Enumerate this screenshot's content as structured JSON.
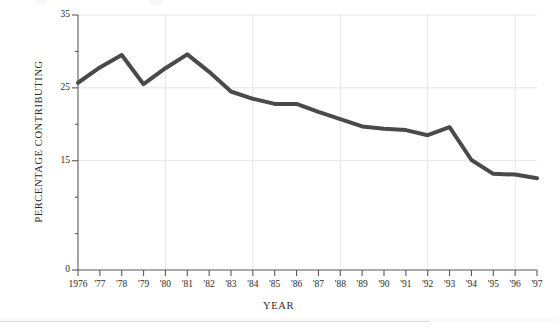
{
  "chart_data": {
    "type": "line",
    "title": "",
    "xlabel": "YEAR",
    "ylabel": "PERCENTAGE CONTRIBUTING",
    "xlim": [
      1976,
      1997
    ],
    "ylim": [
      0,
      35
    ],
    "y_ticks": [
      0,
      15,
      25,
      35
    ],
    "y_tick_labels": [
      "0",
      "15",
      "25",
      "35"
    ],
    "grid": "vertical gridlines every 4 years; horizontal gridlines at 15, 25, 35",
    "grid_y_values": [
      15,
      25,
      35
    ],
    "grid_x_values": [
      1980,
      1984,
      1988,
      1992,
      1996
    ],
    "legend": "none",
    "line_color": "#4a4a4a",
    "line_width": 4,
    "categories": [
      "1976",
      "'77",
      "'78",
      "'79",
      "'80",
      "'81",
      "'82",
      "'83",
      "'84",
      "'85",
      "'86",
      "'87",
      "'88",
      "'89",
      "'90",
      "'91",
      "'92",
      "'93",
      "'94",
      "'95",
      "'96",
      "'97"
    ],
    "x": [
      1976,
      1977,
      1978,
      1979,
      1980,
      1981,
      1982,
      1983,
      1984,
      1985,
      1986,
      1987,
      1988,
      1989,
      1990,
      1991,
      1992,
      1993,
      1994,
      1995,
      1996,
      1997
    ],
    "values": [
      25.7,
      27.8,
      29.5,
      25.5,
      27.7,
      29.6,
      27.2,
      24.5,
      23.5,
      22.8,
      22.8,
      21.7,
      20.7,
      19.7,
      19.4,
      19.2,
      18.5,
      19.6,
      15.1,
      13.2,
      13.1,
      12.6
    ],
    "series": [
      {
        "name": "Percentage contributing",
        "values": [
          25.7,
          27.8,
          29.5,
          25.5,
          27.7,
          29.6,
          27.2,
          24.5,
          23.5,
          22.8,
          22.8,
          21.7,
          20.7,
          19.7,
          19.4,
          19.2,
          18.5,
          19.6,
          15.1,
          13.2,
          13.1,
          12.6
        ]
      }
    ]
  },
  "colors": {
    "line": "#4a4a4a",
    "axis": "#5a5a5a",
    "grid": "#e6e6e4",
    "text": "#2b2b2b",
    "background": "#ffffff"
  }
}
